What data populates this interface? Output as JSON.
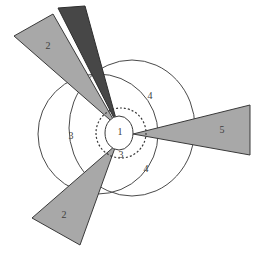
{
  "figure": {
    "title": "",
    "background_color": "#ffffff",
    "width": 265,
    "height": 260
  },
  "palette": {
    "light_gray_fill": "#a8a8a8",
    "dark_gray_fill": "#474747",
    "outline_stroke": "#3a3a3a",
    "curve_stroke": "#4a4a4a",
    "label_color": "#404040",
    "white_fill": "#ffffff"
  },
  "labels": {
    "center_region": "1",
    "upper_left_wedge": "2",
    "lower_left_wedge": "2",
    "left_circle_region": "3",
    "dotted_ring_region": "3",
    "upper_ellipse_region": "4",
    "lower_ellipse_region": "4",
    "right_wedge": "5"
  },
  "shapes": {
    "left_circle": {
      "name": "left-circle",
      "cx": 98,
      "cy": 134,
      "r": 60,
      "fill": "none",
      "stroke": "#4a4a4a"
    },
    "right_ellipse": {
      "name": "right-ellipse",
      "cx": 132,
      "cy": 128,
      "rx": 63,
      "ry": 68,
      "fill": "none",
      "stroke": "#4a4a4a"
    },
    "center_ellipse": {
      "name": "center-ellipse",
      "cx": 119,
      "cy": 133,
      "rx": 14,
      "ry": 17,
      "fill": "#ffffff",
      "stroke": "#3a3a3a"
    },
    "dotted_ring": {
      "name": "dotted-ring",
      "cx": 121,
      "cy": 133,
      "r": 25,
      "fill": "none",
      "stroke": "#3a3a3a",
      "dash": "2,2"
    },
    "upper_left_light_wedge": {
      "name": "upper-left-light-wedge",
      "points": "14,36 53,14 117,126",
      "fill": "#a8a8a8"
    },
    "upper_left_dark_wedge": {
      "name": "upper-left-dark-wedge",
      "points": "58,8 84,6 117,126",
      "fill": "#474747"
    },
    "lower_left_wedge": {
      "name": "lower-left-wedge",
      "points": "32,218 80,245 116,145",
      "fill": "#a8a8a8"
    },
    "right_wedge": {
      "name": "right-wedge",
      "points": "133,134 250,105 250,155",
      "fill": "#a8a8a8"
    }
  },
  "label_positions": {
    "center_region": {
      "x": 120,
      "y": 133
    },
    "upper_left_wedge": {
      "x": 48,
      "y": 47
    },
    "lower_left_wedge": {
      "x": 64,
      "y": 216
    },
    "left_circle_region": {
      "x": 71,
      "y": 137
    },
    "dotted_ring_region": {
      "x": 121,
      "y": 156
    },
    "upper_ellipse_region": {
      "x": 150,
      "y": 97
    },
    "lower_ellipse_region": {
      "x": 146,
      "y": 170
    },
    "right_wedge": {
      "x": 222,
      "y": 131
    }
  }
}
